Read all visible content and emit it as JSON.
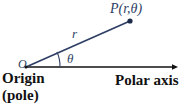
{
  "figure": {
    "background_color": "#ffffff",
    "width": 182,
    "height": 111
  },
  "colors": {
    "ray_and_math_text": "#2e3f63",
    "axis_and_plain_text": "#111111",
    "background": "#ffffff"
  },
  "labels": {
    "point_P": "P(r,θ)",
    "point_P_name": "P",
    "point_P_args": "(r,θ)",
    "radius": "r",
    "angle": "θ",
    "origin_symbol": "O",
    "origin_word": "Origin",
    "pole_word": "(pole)",
    "polar_axis": "Polar axis"
  },
  "geometry": {
    "origin": {
      "x": 26,
      "y": 67
    },
    "point_P": {
      "x": 130,
      "y": 21
    },
    "polar_axis_end": {
      "x": 177,
      "y": 67
    },
    "arc_radius": 34,
    "angle_degrees": 24
  },
  "elements": {
    "ray_name": "radius-ray",
    "axis_name": "polar-axis-line",
    "arc_name": "angle-arc",
    "point_dot_name": "point-p-dot",
    "arrow_name": "polar-axis-arrowhead"
  }
}
